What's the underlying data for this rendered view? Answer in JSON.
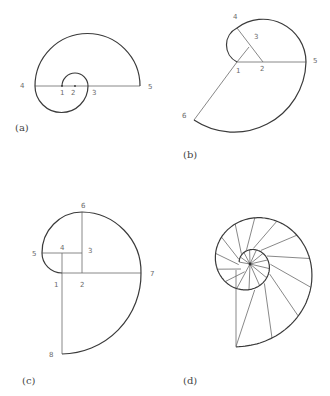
{
  "figure": {
    "panels": [
      {
        "id": "a",
        "caption": "(a)",
        "caption_pos": [
          15,
          131
        ],
        "points": [
          {
            "label": "1",
            "x": 62,
            "y": 86,
            "lx": 60,
            "ly": 95
          },
          {
            "label": "2",
            "x": 75,
            "y": 86,
            "lx": 71,
            "ly": 95
          },
          {
            "label": "3",
            "x": 88,
            "y": 86,
            "lx": 92,
            "ly": 95
          },
          {
            "label": "4",
            "x": 35,
            "y": 86,
            "lx": 20,
            "ly": 88
          },
          {
            "label": "5",
            "x": 140,
            "y": 86,
            "lx": 148,
            "ly": 89
          }
        ]
      },
      {
        "id": "b",
        "caption": "(b)",
        "caption_pos": [
          183,
          158
        ],
        "points": [
          {
            "label": "1",
            "x": 237,
            "y": 62,
            "lx": 236,
            "ly": 73
          },
          {
            "label": "2",
            "x": 263,
            "y": 62,
            "lx": 260,
            "ly": 71
          },
          {
            "label": "3",
            "x": 249,
            "y": 47,
            "lx": 254,
            "ly": 39
          },
          {
            "label": "4",
            "x": 237,
            "y": 28,
            "lx": 233,
            "ly": 19
          },
          {
            "label": "5",
            "x": 306,
            "y": 62,
            "lx": 313,
            "ly": 63
          },
          {
            "label": "6",
            "x": 194,
            "y": 120,
            "lx": 182,
            "ly": 118
          }
        ]
      },
      {
        "id": "c",
        "caption": "(c)",
        "caption_pos": [
          22,
          384
        ],
        "points": [
          {
            "label": "1",
            "x": 62,
            "y": 273,
            "lx": 54,
            "ly": 287
          },
          {
            "label": "2",
            "x": 82,
            "y": 273,
            "lx": 80,
            "ly": 287
          },
          {
            "label": "3",
            "x": 82,
            "y": 253,
            "lx": 88,
            "ly": 253
          },
          {
            "label": "4",
            "x": 62,
            "y": 253,
            "lx": 60,
            "ly": 250
          },
          {
            "label": "5",
            "x": 42,
            "y": 253,
            "lx": 32,
            "ly": 256
          },
          {
            "label": "6",
            "x": 82,
            "y": 212,
            "lx": 81,
            "ly": 208
          },
          {
            "label": "7",
            "x": 141,
            "y": 273,
            "lx": 150,
            "ly": 276
          },
          {
            "label": "8",
            "x": 62,
            "y": 354,
            "lx": 49,
            "ly": 357
          }
        ]
      },
      {
        "id": "d",
        "caption": "(d)",
        "caption_pos": [
          183,
          384
        ],
        "hub": {
          "x": 250,
          "y": 264
        }
      }
    ]
  }
}
